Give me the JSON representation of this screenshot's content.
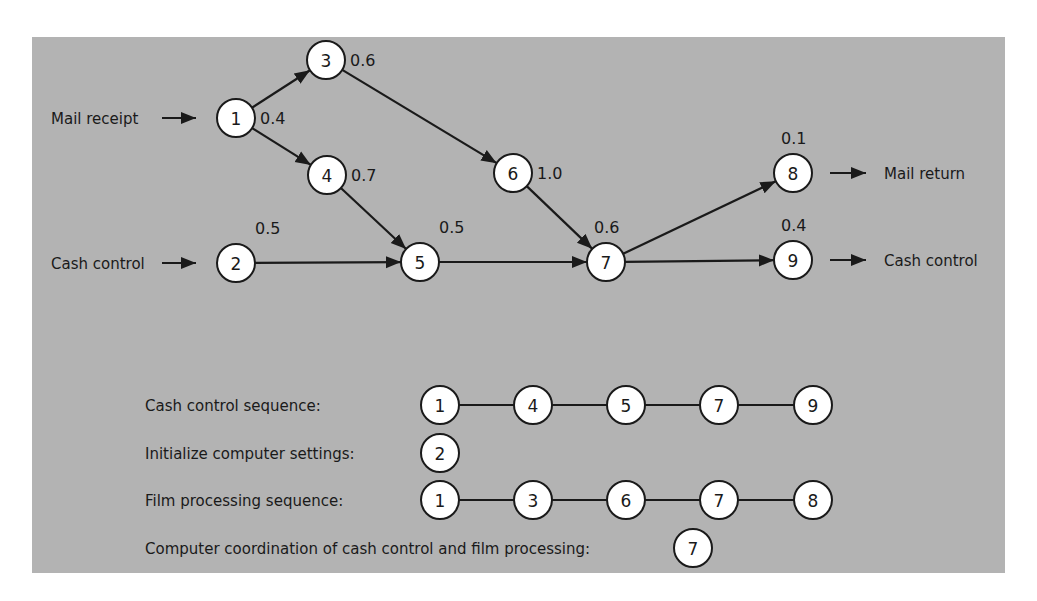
{
  "colors": {
    "panel": "#b3b3b3",
    "node_fill": "#ffffff",
    "ink": "#1a1a1a"
  },
  "graph": {
    "inputs": [
      {
        "label": "Mail receipt",
        "to": "1"
      },
      {
        "label": "Cash control",
        "to": "2"
      }
    ],
    "outputs": [
      {
        "label": "Mail return",
        "from": "8"
      },
      {
        "label": "Cash control",
        "from": "9"
      }
    ],
    "nodes": [
      {
        "id": "1",
        "x": 236,
        "y": 118,
        "value": "0.4"
      },
      {
        "id": "2",
        "x": 236,
        "y": 263,
        "value": "0.5"
      },
      {
        "id": "3",
        "x": 326,
        "y": 60,
        "value": "0.6"
      },
      {
        "id": "4",
        "x": 327,
        "y": 175,
        "value": "0.7"
      },
      {
        "id": "5",
        "x": 420,
        "y": 262,
        "value": "0.5"
      },
      {
        "id": "6",
        "x": 513,
        "y": 173,
        "value": "1.0"
      },
      {
        "id": "7",
        "x": 606,
        "y": 262,
        "value": "0.6"
      },
      {
        "id": "8",
        "x": 793,
        "y": 173,
        "value": "0.1"
      },
      {
        "id": "9",
        "x": 793,
        "y": 260,
        "value": "0.4"
      }
    ],
    "edges": [
      [
        "1",
        "3"
      ],
      [
        "1",
        "4"
      ],
      [
        "3",
        "6"
      ],
      [
        "4",
        "5"
      ],
      [
        "2",
        "5"
      ],
      [
        "6",
        "7"
      ],
      [
        "5",
        "7"
      ],
      [
        "7",
        "8"
      ],
      [
        "7",
        "9"
      ]
    ]
  },
  "sequences": [
    {
      "label": "Cash control sequence:",
      "nodes": [
        "1",
        "4",
        "5",
        "7",
        "9"
      ]
    },
    {
      "label": "Initialize computer settings:",
      "nodes": [
        "2"
      ]
    },
    {
      "label": "Film processing sequence:",
      "nodes": [
        "1",
        "3",
        "6",
        "7",
        "8"
      ]
    },
    {
      "label": "Computer coordination of cash control and film processing:",
      "nodes": [
        "7"
      ]
    }
  ]
}
